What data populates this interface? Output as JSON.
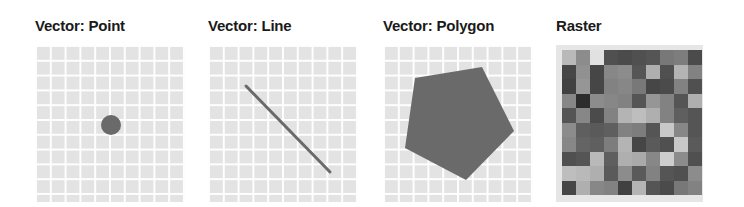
{
  "panels": [
    {
      "title": "Vector: Point",
      "type": "point"
    },
    {
      "title": "Vector: Line",
      "type": "line"
    },
    {
      "title": "Vector: Polygon",
      "type": "polygon"
    },
    {
      "title": "Raster",
      "type": "raster"
    }
  ],
  "colors": {
    "feature": "#6a6a6a",
    "grid_fill": "#e3e3e3",
    "grid_line": "#ffffff",
    "title": "#1a1a1a"
  },
  "point": {
    "cx": 76,
    "cy": 80,
    "r": 10
  },
  "line": {
    "x1": 38,
    "y1": 41,
    "x2": 122,
    "y2": 127,
    "stroke_width": 3
  },
  "polygon": {
    "points": "32,33 99,22 131,86 83,135 22,103"
  },
  "raster": {
    "columns": 10,
    "rows": 10,
    "values": [
      [
        185,
        140,
        225,
        80,
        75,
        80,
        85,
        120,
        125,
        75
      ],
      [
        70,
        145,
        70,
        135,
        140,
        85,
        175,
        80,
        180,
        130
      ],
      [
        65,
        150,
        70,
        130,
        135,
        120,
        70,
        75,
        130,
        80
      ],
      [
        135,
        45,
        140,
        135,
        130,
        85,
        150,
        130,
        85,
        175
      ],
      [
        85,
        135,
        75,
        130,
        180,
        190,
        175,
        130,
        95,
        85
      ],
      [
        140,
        95,
        90,
        95,
        130,
        125,
        85,
        200,
        135,
        85
      ],
      [
        135,
        100,
        95,
        125,
        180,
        70,
        90,
        80,
        200,
        90
      ],
      [
        80,
        85,
        185,
        95,
        175,
        170,
        135,
        205,
        140,
        80
      ],
      [
        190,
        185,
        175,
        90,
        140,
        90,
        130,
        85,
        80,
        140
      ],
      [
        70,
        175,
        135,
        130,
        65,
        180,
        85,
        75,
        120,
        130
      ]
    ]
  }
}
